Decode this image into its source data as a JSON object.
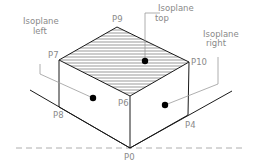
{
  "diagram": {
    "isoplanes": [
      {
        "id": "left",
        "label_line1": "Isoplane",
        "label_line2": "left"
      },
      {
        "id": "top",
        "label_line1": "Isoplane",
        "label_line2": "top"
      },
      {
        "id": "right",
        "label_line1": "Isoplane",
        "label_line2": "right"
      }
    ],
    "points": {
      "P0": "P0",
      "P4": "P4",
      "P6": "P6",
      "P7": "P7",
      "P8": "P8",
      "P9": "P9",
      "P10": "P10"
    },
    "colors": {
      "edge": "#1a1a1a",
      "label": "#8a8a8a",
      "leader": "#9a9a9a",
      "dashed": "#9a9a9a"
    }
  }
}
